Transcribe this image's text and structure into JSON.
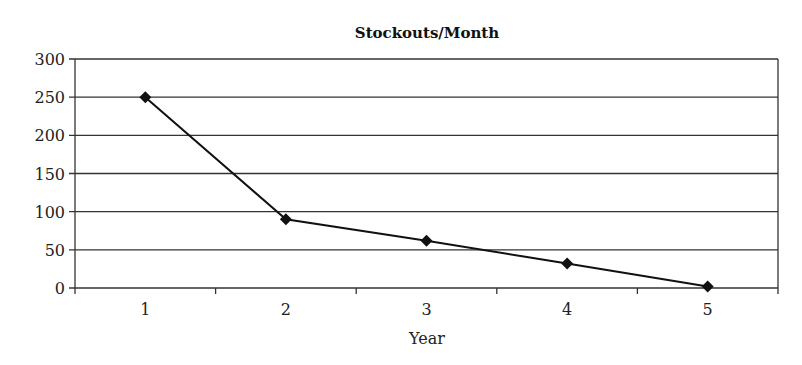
{
  "chart_data": {
    "type": "line",
    "title": "Stockouts/Month",
    "xlabel": "Year",
    "ylabel": "",
    "categories": [
      "1",
      "2",
      "3",
      "4",
      "5"
    ],
    "series": [
      {
        "name": "Stockouts/Month",
        "values": [
          250,
          90,
          62,
          32,
          2
        ],
        "marker": "diamond",
        "color": "#111111"
      }
    ],
    "ylim": [
      0,
      300
    ],
    "yticks": [
      0,
      50,
      100,
      150,
      200,
      250,
      300
    ],
    "grid": true,
    "legend": "none"
  }
}
